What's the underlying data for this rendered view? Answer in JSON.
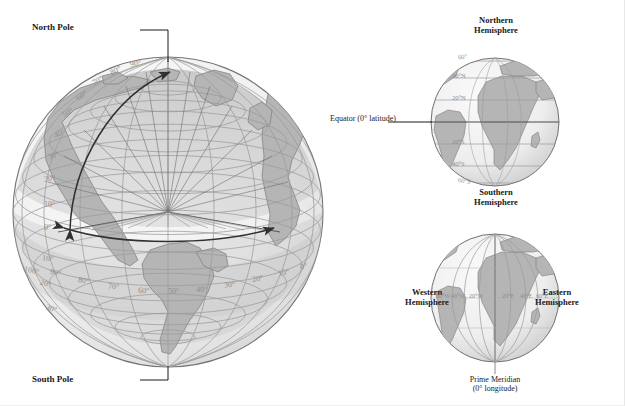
{
  "figure": {
    "background_color": "#ffffff"
  },
  "colors": {
    "ocean": "#f0f0f0",
    "land": "#b9b9b9",
    "graticule": "#9a9a9a",
    "outline": "#6b6b6b",
    "label_gray": "#8e8e8e",
    "label_dark": "#1a1a1a",
    "shade_cap": "#c6c6c6",
    "arrow": "#3a3a3a"
  },
  "main_globe": {
    "name": "main-globe",
    "pole_labels": {
      "north": "North Pole",
      "south": "South Pole"
    },
    "latitude_labels": [
      "90°",
      "80°",
      "70°",
      "60°",
      "50°",
      "40°",
      "30°",
      "20°",
      "10°",
      "0°"
    ],
    "south_latitude_labels": [
      "10°",
      "20°",
      "30°"
    ],
    "longitude_labels": [
      "100°",
      "90°",
      "80°",
      "70°",
      "60°",
      "50°",
      "40°",
      "30°",
      "20°",
      "10°",
      "0°"
    ],
    "arrows": {
      "latitude_arc_name": "latitude-measure-arrow",
      "longitude_arc_name": "longitude-measure-arrow"
    }
  },
  "lat_globe": {
    "name": "latitude-hemisphere-globe",
    "top_label": "Northern\nHemisphere",
    "top_label_line1": "Northern",
    "top_label_line2": "Hemisphere",
    "bottom_label_line1": "Southern",
    "bottom_label_line2": "Hemisphere",
    "equator_callout": "Equator (0° latitude)",
    "parallels": [
      "60°",
      "40°N",
      "20°N",
      "20°S",
      "40°S",
      "60°S"
    ]
  },
  "lon_globe": {
    "name": "longitude-hemisphere-globe",
    "left_label_line1": "Western",
    "left_label_line2": "Hemisphere",
    "right_label_line1": "Eastern",
    "right_label_line2": "Hemisphere",
    "prime_meridian_line1": "Prime Meridian",
    "prime_meridian_line2": "(0° longitude)",
    "meridians_west": [
      "60°W",
      "40°W",
      "20°W"
    ],
    "meridians_east": [
      "20°E",
      "40°E",
      "60°E"
    ]
  }
}
